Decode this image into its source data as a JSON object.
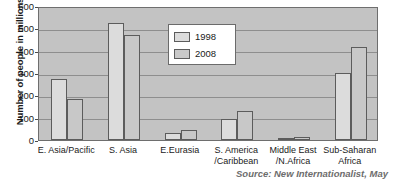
{
  "chart_data": {
    "type": "bar",
    "title": "",
    "xlabel": "",
    "ylabel": "Number of people in millions",
    "ylim": [
      0,
      600
    ],
    "yticks": [
      0,
      100,
      200,
      300,
      400,
      500,
      600
    ],
    "grid": true,
    "legend_position": "inside-upper-center",
    "categories": [
      "E. Asia/Pacific",
      "S. Asia",
      "E.Eurasia",
      "S. America\n/Caribbean",
      "Middle East\n/N.Africa",
      "Sub-Saharan\nAfrica"
    ],
    "series": [
      {
        "name": "1998",
        "values": [
          275,
          525,
          30,
          95,
          10,
          300
        ]
      },
      {
        "name": "2008",
        "values": [
          185,
          470,
          45,
          130,
          15,
          415
        ]
      }
    ]
  },
  "legend": {
    "entries": [
      {
        "label": "1998"
      },
      {
        "label": "2008"
      }
    ]
  },
  "footer": {
    "source": "Source: New Internationalist, May"
  },
  "colors": {
    "plot_background": "#c3c3c3",
    "gridline": "#8e8e8e",
    "bar_1998": "#dcdcdc",
    "bar_2008": "#c8c8c8",
    "bar_outline": "#5c5c5c",
    "axis": "#6e6e6e",
    "text": "#1a1a1a",
    "source_text": "#6d6d6d"
  }
}
